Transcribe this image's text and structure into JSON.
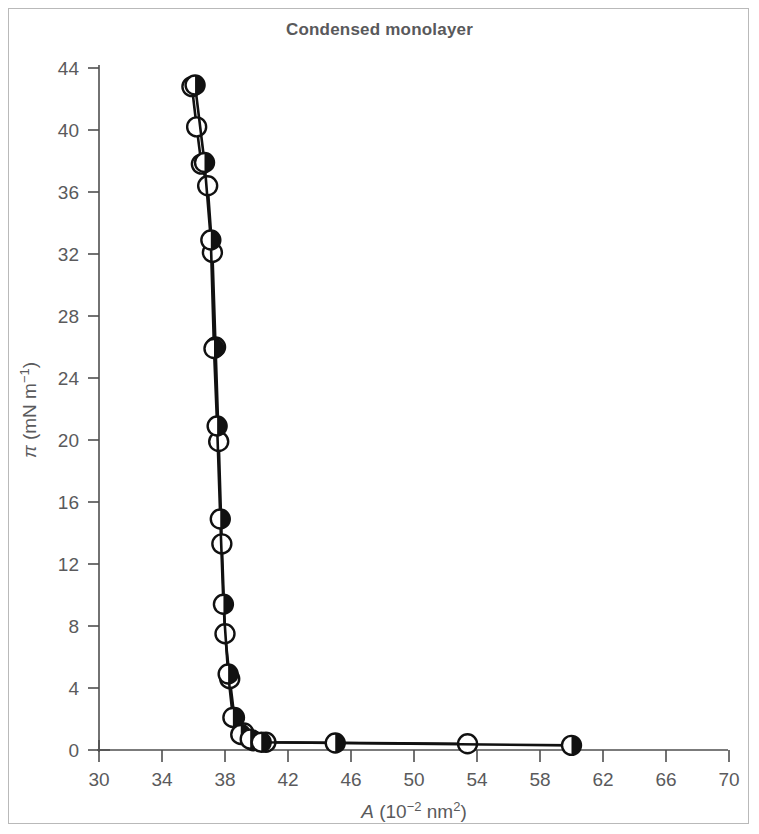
{
  "figure": {
    "title": "Condensed monolayer",
    "border_color": "#b9b9b9",
    "background": "#ffffff",
    "title_color": "#59595b"
  },
  "axes": {
    "x": {
      "label_main": "A",
      "label_paren_open": " (10",
      "label_exp": "−2",
      "label_unit": " nm",
      "label_unit_exp": "2",
      "label_paren_close": ")",
      "label_full": "A (10−2 nm2)",
      "ticks": [
        30,
        34,
        38,
        42,
        46,
        50,
        54,
        58,
        62,
        66,
        70
      ],
      "min": 30,
      "max": 70
    },
    "y": {
      "label_full": "π (mN m−1)",
      "label_symbol": "π",
      "label_paren_open": " (mN m",
      "label_exp": "−1",
      "label_paren_close": ")",
      "ticks": [
        0,
        4,
        8,
        12,
        16,
        20,
        24,
        28,
        32,
        36,
        40,
        44
      ],
      "min": 0,
      "max": 44
    }
  },
  "chart_data": {
    "type": "line",
    "title": "Condensed monolayer",
    "xlabel": "A (10−2 nm2)",
    "ylabel": "π (mN m−1)",
    "xlim": [
      30,
      70
    ],
    "ylim": [
      0,
      44
    ],
    "xticks": [
      30,
      34,
      38,
      42,
      46,
      50,
      54,
      58,
      62,
      66,
      70
    ],
    "yticks": [
      0,
      4,
      8,
      12,
      16,
      20,
      24,
      28,
      32,
      36,
      40,
      44
    ],
    "grid": false,
    "legend": false,
    "marker_colors": {
      "line": "#111111",
      "open_fill": "#ffffff",
      "half_fill": "#111111"
    },
    "series": [
      {
        "name": "Series A (open circles)",
        "marker": "open-circle",
        "x": [
          35.9,
          36.2,
          36.5,
          36.9,
          37.2,
          37.4,
          37.6,
          37.8,
          38.0,
          38.3,
          38.6,
          39.2,
          39.8,
          40.6,
          53.4
        ],
        "y": [
          42.8,
          40.2,
          37.8,
          36.4,
          32.1,
          26.0,
          19.9,
          13.3,
          7.5,
          4.6,
          2.1,
          1.1,
          0.6,
          0.5,
          0.4
        ]
      },
      {
        "name": "Series B (half-filled circles)",
        "marker": "half-filled-circle",
        "x": [
          36.1,
          36.7,
          37.1,
          37.3,
          37.5,
          37.7,
          37.9,
          38.2,
          38.5,
          39.0,
          39.6,
          40.3,
          45.0,
          60.0
        ],
        "y": [
          42.9,
          37.9,
          32.9,
          25.9,
          20.9,
          14.9,
          9.4,
          4.9,
          2.1,
          1.0,
          0.7,
          0.5,
          0.45,
          0.3
        ]
      }
    ],
    "curve_description": "L-shaped surface pressure isotherm: near-vertical rise below A ≈ 40 and a flat plateau near π ≈ 0 extending to A ≈ 60"
  }
}
